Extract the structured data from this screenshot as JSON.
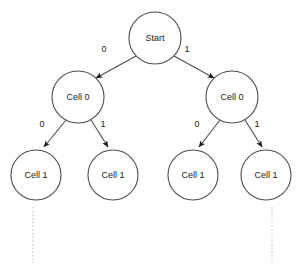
{
  "diagram": {
    "type": "tree",
    "colors": {
      "node_stroke": "#4d4d4d",
      "node_fill": "#ffffff",
      "edge_stroke": "#4d4d4d",
      "text": "#1a1a1a",
      "continuation": "#cccccc",
      "background": "#ffffff"
    },
    "nodes": [
      {
        "id": "start",
        "label": "Start",
        "cx": 155,
        "cy": 38,
        "r": 26,
        "level": 0
      },
      {
        "id": "c0l",
        "label": "Cell 0",
        "cx": 78,
        "cy": 97,
        "r": 26,
        "level": 1
      },
      {
        "id": "c0r",
        "label": "Cell 0",
        "cx": 232,
        "cy": 97,
        "r": 26,
        "level": 1
      },
      {
        "id": "c1a",
        "label": "Cell 1",
        "cx": 36,
        "cy": 175,
        "r": 25,
        "level": 2
      },
      {
        "id": "c1b",
        "label": "Cell 1",
        "cx": 113,
        "cy": 175,
        "r": 25,
        "level": 2
      },
      {
        "id": "c1c",
        "label": "Cell 1",
        "cx": 193,
        "cy": 175,
        "r": 25,
        "level": 2
      },
      {
        "id": "c1d",
        "label": "Cell 1",
        "cx": 266,
        "cy": 175,
        "r": 25,
        "level": 2
      }
    ],
    "edges": [
      {
        "id": "e-start-left",
        "from": "start",
        "to": "c0l",
        "label": "0",
        "label_x": 104,
        "label_y": 49
      },
      {
        "id": "e-start-right",
        "from": "start",
        "to": "c0r",
        "label": "1",
        "label_x": 187,
        "label_y": 49
      },
      {
        "id": "e-c0l-left",
        "from": "c0l",
        "to": "c1a",
        "label": "0",
        "label_x": 42,
        "label_y": 124
      },
      {
        "id": "e-c0l-right",
        "from": "c0l",
        "to": "c1b",
        "label": "1",
        "label_x": 103,
        "label_y": 124
      },
      {
        "id": "e-c0r-left",
        "from": "c0r",
        "to": "c1c",
        "label": "0",
        "label_x": 197,
        "label_y": 124
      },
      {
        "id": "e-c0r-right",
        "from": "c0r",
        "to": "c1d",
        "label": "1",
        "label_x": 257,
        "label_y": 124
      }
    ],
    "continuations": [
      {
        "id": "cont-left",
        "x": 33,
        "y1": 207,
        "y2": 263
      },
      {
        "id": "cont-right",
        "x": 272,
        "y1": 207,
        "y2": 263
      }
    ]
  }
}
